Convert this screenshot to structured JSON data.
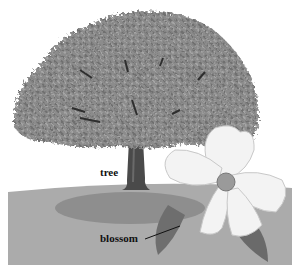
{
  "labels": {
    "tree": "tree",
    "blossom": "blossom"
  },
  "colors": {
    "background": "#ffffff",
    "ground": "#a9a9a9",
    "shadow": "#8f8f8f",
    "foliage": "#8a8a8a",
    "trunk": "#4a4a4a",
    "petal": "#f2f2f2",
    "leaf": "#6e6e6e"
  }
}
